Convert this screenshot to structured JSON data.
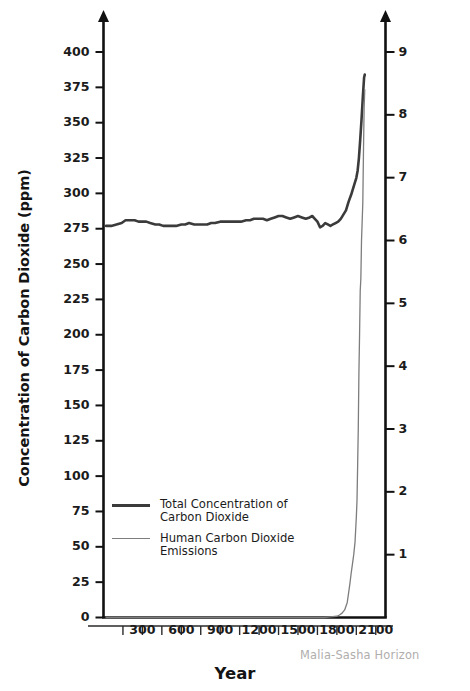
{
  "chart_data": {
    "type": "line",
    "title": "",
    "xlabel": "Year",
    "ylabel": "Concentration of Carbon Dioxide (ppm)",
    "ylabel_right": "Human Carbon Dioxide Emissions (Gigatons of Carbon per year)",
    "xlim": [
      0,
      2175
    ],
    "ylim": [
      0,
      415
    ],
    "ylim_right": [
      0,
      9.3
    ],
    "grid": false,
    "legend_position": "inside-lower-left",
    "xticks_major": [
      "300",
      "600",
      "900",
      "1200",
      "1500",
      "1800",
      "2100"
    ],
    "xtick_major_values": [
      300,
      600,
      900,
      1200,
      1500,
      1800,
      2100
    ],
    "xtick_minor_values": [
      150,
      450,
      750,
      1050,
      1350,
      1650,
      1950
    ],
    "yticks_left": [
      "0",
      "25",
      "50",
      "75",
      "100",
      "125",
      "150",
      "175",
      "200",
      "225",
      "250",
      "275",
      "300",
      "325",
      "350",
      "375",
      "400"
    ],
    "ytick_left_values": [
      0,
      25,
      50,
      75,
      100,
      125,
      150,
      175,
      200,
      225,
      250,
      275,
      300,
      325,
      350,
      375,
      400
    ],
    "yticks_right": [
      "1",
      "2",
      "3",
      "4",
      "5",
      "6",
      "7",
      "8",
      "9"
    ],
    "ytick_right_values": [
      1,
      2,
      3,
      4,
      5,
      6,
      7,
      8,
      9
    ],
    "series": [
      {
        "name": "Total Concentration of Carbon Dioxide",
        "axis": "left",
        "color": "#3b3b3b",
        "width": 2.6,
        "x": [
          20,
          60,
          100,
          140,
          170,
          200,
          240,
          270,
          300,
          330,
          360,
          400,
          430,
          460,
          500,
          530,
          560,
          600,
          630,
          660,
          700,
          730,
          760,
          800,
          830,
          860,
          900,
          930,
          960,
          1000,
          1030,
          1060,
          1100,
          1130,
          1160,
          1200,
          1230,
          1260,
          1290,
          1320,
          1350,
          1380,
          1410,
          1440,
          1470,
          1500,
          1530,
          1560,
          1590,
          1610,
          1630,
          1650,
          1670,
          1690,
          1710,
          1730,
          1750,
          1770,
          1790,
          1810,
          1830,
          1850,
          1870,
          1890,
          1910,
          1930,
          1950,
          1960,
          1970,
          1980,
          1990,
          2000,
          2010,
          2015
        ],
        "y": [
          277,
          277,
          278,
          279,
          281,
          281,
          281,
          280,
          280,
          280,
          279,
          278,
          278,
          277,
          277,
          277,
          277,
          278,
          278,
          279,
          278,
          278,
          278,
          278,
          279,
          279,
          280,
          280,
          280,
          280,
          280,
          280,
          281,
          281,
          282,
          282,
          282,
          281,
          282,
          283,
          284,
          284,
          283,
          282,
          283,
          284,
          283,
          282,
          283,
          284,
          282,
          280,
          276,
          277,
          279,
          278,
          277,
          278,
          279,
          280,
          282,
          285,
          288,
          294,
          299,
          305,
          311,
          316,
          325,
          338,
          352,
          368,
          382,
          384
        ]
      },
      {
        "name": "Human Carbon Dioxide Emissions",
        "axis": "right",
        "color": "#7d7d7d",
        "width": 1.3,
        "x": [
          20,
          400,
          800,
          1200,
          1500,
          1700,
          1750,
          1800,
          1820,
          1840,
          1860,
          1880,
          1900,
          1910,
          1920,
          1930,
          1940,
          1950,
          1955,
          1960,
          1965,
          1970,
          1975,
          1980,
          1985,
          1990,
          1995,
          2000,
          2005,
          2010,
          2015
        ],
        "y": [
          0.0,
          0.0,
          0.0,
          0.0,
          0.0,
          0.0,
          0.01,
          0.02,
          0.04,
          0.07,
          0.12,
          0.24,
          0.53,
          0.7,
          0.85,
          1.0,
          1.2,
          1.6,
          1.85,
          2.4,
          3.0,
          3.9,
          4.5,
          5.2,
          5.4,
          6.0,
          6.3,
          6.6,
          7.4,
          8.1,
          8.4
        ]
      }
    ],
    "annotations": [
      {
        "text": "Malia-Sasha Horizon",
        "type": "watermark"
      }
    ]
  },
  "axis_titles": {
    "left": "Concentration of Carbon Dioxide (ppm)",
    "right": "Human Carbon Dioxide Emissions (Gigatons of Carbon per year)",
    "bottom": "Year"
  },
  "legend": {
    "items": [
      {
        "label": "Total Concentration of\nCarbon Dioxide",
        "line": "thick"
      },
      {
        "label": "Human Carbon Dioxide\nEmissions",
        "line": "thin"
      }
    ]
  },
  "watermark": {
    "text": "Malia-Sasha Horizon"
  },
  "colors": {
    "axis": "#111111",
    "concentration_line": "#3b3b3b",
    "emissions_line": "#7d7d7d",
    "watermark": "#b0aeac",
    "background": "#ffffff"
  }
}
